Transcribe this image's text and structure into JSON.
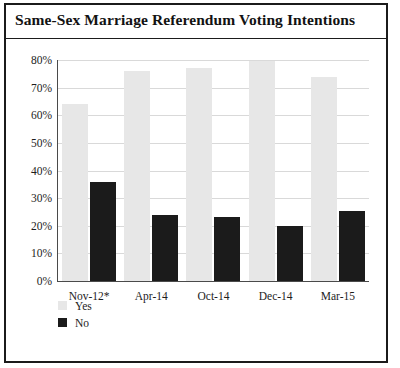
{
  "figure": {
    "title": "Same-Sex Marriage Referendum Voting Intentions",
    "frame_color": "#1b1b1b",
    "background": "#ffffff"
  },
  "legend": {
    "position": "bottom-left",
    "entries": [
      {
        "label": "Yes",
        "color": "#e7e7e7",
        "swatch": "legend-swatch-yes"
      },
      {
        "label": "No",
        "color": "#1b1b1b",
        "swatch": "legend-swatch-no"
      }
    ]
  },
  "axes": {
    "y_ticks": [
      "0%",
      "10%",
      "20%",
      "30%",
      "40%",
      "50%",
      "60%",
      "70%",
      "80%"
    ],
    "x_ticks": [
      "Nov-12*",
      "Apr-14",
      "Oct-14",
      "Dec-14",
      "Mar-15"
    ]
  },
  "chart_data": {
    "type": "bar",
    "title": "Same-Sex Marriage Referendum Voting Intentions",
    "xlabel": "",
    "ylabel": "",
    "categories": [
      "Nov-12*",
      "Apr-14",
      "Oct-14",
      "Dec-14",
      "Mar-15"
    ],
    "series": [
      {
        "name": "Yes",
        "color": "#e7e7e7",
        "values": [
          64,
          76,
          77,
          79.5,
          74
        ]
      },
      {
        "name": "No",
        "color": "#1b1b1b",
        "values": [
          36,
          24,
          23,
          20,
          25.5
        ]
      }
    ],
    "ylim": [
      0,
      80
    ],
    "ytick_interval": 10,
    "ytick_format": "percent",
    "grid": "horizontal",
    "legend_position": "bottom-left"
  }
}
